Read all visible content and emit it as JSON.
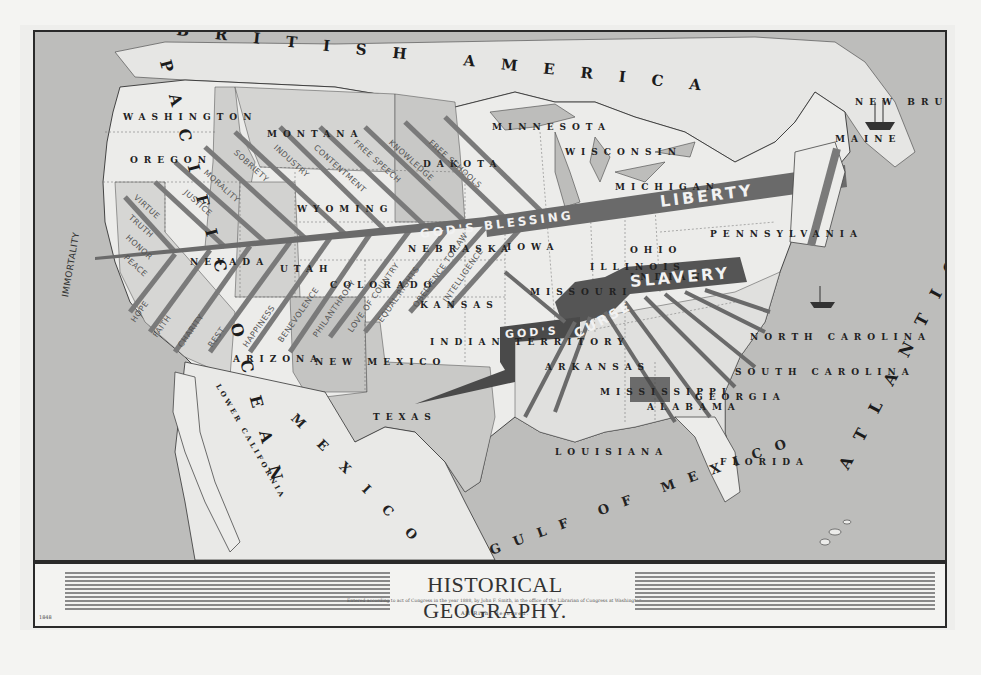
{
  "title": "HISTORICAL GEOGRAPHY.",
  "copyright_line": "Entered according to act of Congress in the year 1888, by John F. Smith, in the office of the Librarian of Congress at Washington.",
  "rights": "All Right Reserved.",
  "plate_number": "1848",
  "regions": {
    "british_america": "BRITISH AMERICA",
    "pacific": "PACIFIC OCEAN",
    "atlantic": "ATLANTIC OCEAN",
    "mexico": "MEXICO",
    "gulf": "GULF OF MEXICO",
    "lower_california": "LOWER CALIFORNIA"
  },
  "states": [
    {
      "name": "WASHINGTON",
      "x": 88,
      "y": 80
    },
    {
      "name": "OREGON",
      "x": 95,
      "y": 123
    },
    {
      "name": "MONTANA",
      "x": 232,
      "y": 97
    },
    {
      "name": "DAKOTA",
      "x": 388,
      "y": 127
    },
    {
      "name": "WYOMING",
      "x": 262,
      "y": 172
    },
    {
      "name": "NEVADA",
      "x": 155,
      "y": 225
    },
    {
      "name": "UTAH",
      "x": 245,
      "y": 232
    },
    {
      "name": "COLORADO",
      "x": 295,
      "y": 248
    },
    {
      "name": "NEBRASKA",
      "x": 373,
      "y": 212
    },
    {
      "name": "IOWA",
      "x": 472,
      "y": 210
    },
    {
      "name": "KANSAS",
      "x": 385,
      "y": 268
    },
    {
      "name": "INDIAN TERRITORY",
      "x": 395,
      "y": 305
    },
    {
      "name": "ARIZONA",
      "x": 198,
      "y": 322
    },
    {
      "name": "NEW MEXICO",
      "x": 280,
      "y": 325
    },
    {
      "name": "TEXAS",
      "x": 338,
      "y": 380
    },
    {
      "name": "OHIO",
      "x": 595,
      "y": 213
    },
    {
      "name": "PENNSYLVANIA",
      "x": 675,
      "y": 197
    },
    {
      "name": "NEW BRUNSWICK",
      "x": 820,
      "y": 65
    },
    {
      "name": "MAINE",
      "x": 800,
      "y": 102
    },
    {
      "name": "MINNESOTA",
      "x": 457,
      "y": 90
    },
    {
      "name": "WISCONSIN",
      "x": 530,
      "y": 115
    },
    {
      "name": "ILLINOIS",
      "x": 555,
      "y": 230
    },
    {
      "name": "INDIANA",
      "x": 595,
      "y": 240
    },
    {
      "name": "MICHIGAN",
      "x": 580,
      "y": 150
    },
    {
      "name": "MISSOURI",
      "x": 495,
      "y": 255
    },
    {
      "name": "ARKANSAS",
      "x": 510,
      "y": 330
    },
    {
      "name": "LOUISIANA",
      "x": 520,
      "y": 415
    },
    {
      "name": "MISSISSIPPI",
      "x": 565,
      "y": 355
    },
    {
      "name": "ALABAMA",
      "x": 612,
      "y": 370
    },
    {
      "name": "GEORGIA",
      "x": 660,
      "y": 360
    },
    {
      "name": "FLORIDA",
      "x": 685,
      "y": 425
    },
    {
      "name": "NORTH CAROLINA",
      "x": 715,
      "y": 300
    },
    {
      "name": "SOUTH CAROLINA",
      "x": 700,
      "y": 335
    }
  ],
  "banners": {
    "blessing_left": "GOD'S",
    "blessing_main": "BLESSING",
    "blessing_right": "LIBERTY",
    "curse_left": "GOD'S",
    "curse_main": "CURSE",
    "curse_right": "SLAVERY"
  },
  "virtues_north": [
    "JUSTICE",
    "MORALITY",
    "SOBRIETY",
    "INDUSTRY",
    "CONTENTMENT",
    "FREE SPEECH",
    "KNOWLEDGE",
    "FREE SCHOOLS",
    "VIRTUE",
    "TRUTH",
    "HONOR",
    "PEACE"
  ],
  "virtues_south": [
    "HOPE",
    "FAITH",
    "CHARITY",
    "REST",
    "HAPPINESS",
    "BENEVOLENCE",
    "PHILANTHROPY",
    "LOVE OF COUNTRY",
    "EQUAL RIGHTS",
    "OBEDIENCE TO LAW",
    "INTELLIGENCE"
  ],
  "terminal_label": "IMMORTALITY",
  "colors": {
    "ocean": "#bdbdbb",
    "land_light": "#ececea",
    "land_shaded": "#cfcfcd",
    "banner": "#6a6a6a",
    "ink": "#222222"
  }
}
